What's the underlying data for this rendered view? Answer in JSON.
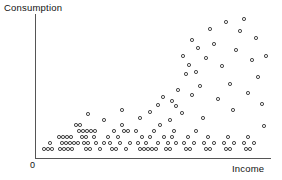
{
  "axes": {
    "y_title": "Consumption",
    "x_title": "Income",
    "origin_label": "0"
  },
  "chart_data": {
    "type": "scatter",
    "title": "",
    "xlabel": "Income",
    "ylabel": "Consumption",
    "xlim": [
      0,
      100
    ],
    "ylim": [
      0,
      100
    ],
    "grid": false,
    "legend": false,
    "marker": "open-circle",
    "marker_color": "#2b2b2b",
    "series": [
      {
        "name": "Households",
        "x": [
          7.0,
          8.6,
          10.2,
          12.2,
          13.8,
          15.4,
          17.0,
          18.6,
          9.4,
          11.0,
          12.6,
          14.2,
          15.8,
          11.8,
          13.4,
          15.0,
          16.6,
          19.0,
          20.6,
          22.2,
          23.8,
          25.4,
          21.0,
          22.6,
          24.2,
          25.8,
          27.4,
          21.4,
          23.0,
          24.6,
          26.2,
          19.8,
          28.6,
          30.2,
          31.8,
          29.0,
          30.6,
          32.2,
          33.8,
          35.4,
          29.4,
          31.0,
          26.6,
          24.6,
          36.6,
          38.2,
          39.8,
          41.4,
          37.0,
          38.6,
          40.2,
          43.0,
          44.6,
          46.2,
          47.8,
          45.0,
          49.4,
          51.0,
          52.6,
          54.2,
          50.2,
          53.0,
          55.8,
          57.4,
          59.0,
          56.2,
          60.6,
          62.2,
          63.8,
          61.0,
          65.4,
          67.0,
          68.6,
          66.2,
          70.2,
          71.8,
          73.4,
          69.0,
          75.0,
          76.6,
          78.2,
          74.0,
          80.0,
          81.6,
          83.2,
          79.2,
          85.0,
          86.6,
          88.2,
          84.2,
          90.0,
          92.0,
          94.0,
          96.0,
          55.0,
          58.0,
          62.0,
          66.0,
          70.0,
          74.0,
          78.0,
          82.0,
          86.0,
          90.0,
          94.0,
          64.0,
          68.0,
          72.0,
          76.0,
          80.0,
          84.0,
          88.0,
          92.0,
          96.0,
          72.0,
          76.0,
          82.0,
          88.0,
          93.0,
          97.0,
          60.0,
          67.0,
          73.0,
          79.0,
          85.0,
          91.0,
          97.0
        ],
        "y": [
          4.0,
          4.0,
          4.0,
          4.0,
          4.0,
          4.0,
          4.0,
          4.0,
          8.0,
          8.0,
          8.0,
          8.0,
          8.0,
          12.0,
          12.0,
          12.0,
          12.0,
          4.0,
          4.0,
          4.0,
          4.0,
          4.0,
          8.0,
          8.0,
          8.0,
          8.0,
          8.0,
          12.0,
          12.0,
          12.0,
          12.0,
          16.0,
          4.0,
          4.0,
          4.0,
          8.0,
          8.0,
          8.0,
          8.0,
          8.0,
          12.0,
          12.0,
          16.0,
          20.0,
          4.0,
          4.0,
          4.0,
          4.0,
          8.0,
          8.0,
          8.0,
          4.0,
          4.0,
          4.0,
          4.0,
          8.0,
          4.0,
          4.0,
          4.0,
          4.0,
          8.0,
          12.0,
          4.0,
          4.0,
          4.0,
          8.0,
          4.0,
          4.0,
          4.0,
          8.0,
          4.0,
          4.0,
          4.0,
          8.0,
          4.0,
          4.0,
          4.0,
          8.0,
          4.0,
          4.0,
          4.0,
          8.0,
          4.0,
          4.0,
          4.0,
          8.0,
          4.0,
          4.0,
          4.0,
          8.0,
          4.0,
          4.0,
          4.0,
          4.0,
          24.0,
          20.0,
          28.0,
          24.0,
          32.0,
          36.0,
          30.0,
          40.0,
          44.0,
          38.0,
          34.0,
          48.0,
          52.0,
          46.0,
          56.0,
          60.0,
          54.0,
          64.0,
          58.0,
          50.0,
          70.0,
          66.0,
          76.0,
          80.0,
          74.0,
          68.0,
          42.0,
          62.0,
          72.0,
          84.0,
          88.0,
          82.0,
          78.0
        ]
      }
    ]
  },
  "points": [
    {
      "x": 44,
      "y": 149
    },
    {
      "x": 48,
      "y": 149
    },
    {
      "x": 52,
      "y": 149
    },
    {
      "x": 60,
      "y": 149
    },
    {
      "x": 64,
      "y": 149
    },
    {
      "x": 68,
      "y": 149
    },
    {
      "x": 72,
      "y": 149
    },
    {
      "x": 50,
      "y": 143
    },
    {
      "x": 62,
      "y": 143
    },
    {
      "x": 66,
      "y": 143
    },
    {
      "x": 70,
      "y": 143
    },
    {
      "x": 74,
      "y": 143
    },
    {
      "x": 78,
      "y": 143
    },
    {
      "x": 59,
      "y": 137
    },
    {
      "x": 63,
      "y": 137
    },
    {
      "x": 67,
      "y": 137
    },
    {
      "x": 71,
      "y": 137
    },
    {
      "x": 86,
      "y": 149
    },
    {
      "x": 90,
      "y": 149
    },
    {
      "x": 100,
      "y": 149
    },
    {
      "x": 84,
      "y": 143
    },
    {
      "x": 88,
      "y": 143
    },
    {
      "x": 96,
      "y": 143
    },
    {
      "x": 104,
      "y": 143
    },
    {
      "x": 82,
      "y": 137
    },
    {
      "x": 86,
      "y": 137
    },
    {
      "x": 94,
      "y": 137
    },
    {
      "x": 79,
      "y": 131
    },
    {
      "x": 83,
      "y": 131
    },
    {
      "x": 87,
      "y": 131
    },
    {
      "x": 91,
      "y": 131
    },
    {
      "x": 95,
      "y": 131
    },
    {
      "x": 76,
      "y": 125
    },
    {
      "x": 80,
      "y": 125
    },
    {
      "x": 88,
      "y": 114
    },
    {
      "x": 112,
      "y": 149
    },
    {
      "x": 116,
      "y": 149
    },
    {
      "x": 126,
      "y": 149
    },
    {
      "x": 110,
      "y": 143
    },
    {
      "x": 120,
      "y": 143
    },
    {
      "x": 130,
      "y": 143
    },
    {
      "x": 108,
      "y": 137
    },
    {
      "x": 118,
      "y": 137
    },
    {
      "x": 114,
      "y": 131
    },
    {
      "x": 124,
      "y": 131
    },
    {
      "x": 128,
      "y": 131
    },
    {
      "x": 122,
      "y": 125
    },
    {
      "x": 104,
      "y": 120
    },
    {
      "x": 140,
      "y": 149
    },
    {
      "x": 144,
      "y": 149
    },
    {
      "x": 148,
      "y": 149
    },
    {
      "x": 152,
      "y": 149
    },
    {
      "x": 156,
      "y": 149
    },
    {
      "x": 138,
      "y": 143
    },
    {
      "x": 146,
      "y": 143
    },
    {
      "x": 158,
      "y": 143
    },
    {
      "x": 142,
      "y": 137
    },
    {
      "x": 150,
      "y": 137
    },
    {
      "x": 136,
      "y": 131
    },
    {
      "x": 154,
      "y": 131
    },
    {
      "x": 160,
      "y": 125
    },
    {
      "x": 166,
      "y": 149
    },
    {
      "x": 170,
      "y": 149
    },
    {
      "x": 168,
      "y": 143
    },
    {
      "x": 176,
      "y": 143
    },
    {
      "x": 164,
      "y": 137
    },
    {
      "x": 172,
      "y": 137
    },
    {
      "x": 174,
      "y": 131
    },
    {
      "x": 186,
      "y": 149
    },
    {
      "x": 190,
      "y": 149
    },
    {
      "x": 184,
      "y": 143
    },
    {
      "x": 194,
      "y": 143
    },
    {
      "x": 188,
      "y": 137
    },
    {
      "x": 196,
      "y": 131
    },
    {
      "x": 206,
      "y": 149
    },
    {
      "x": 210,
      "y": 149
    },
    {
      "x": 204,
      "y": 143
    },
    {
      "x": 214,
      "y": 143
    },
    {
      "x": 208,
      "y": 137
    },
    {
      "x": 226,
      "y": 149
    },
    {
      "x": 230,
      "y": 149
    },
    {
      "x": 224,
      "y": 143
    },
    {
      "x": 234,
      "y": 143
    },
    {
      "x": 228,
      "y": 137
    },
    {
      "x": 246,
      "y": 149
    },
    {
      "x": 250,
      "y": 149
    },
    {
      "x": 244,
      "y": 143
    },
    {
      "x": 254,
      "y": 143
    },
    {
      "x": 248,
      "y": 137
    },
    {
      "x": 122,
      "y": 110
    },
    {
      "x": 140,
      "y": 118
    },
    {
      "x": 150,
      "y": 112
    },
    {
      "x": 158,
      "y": 105
    },
    {
      "x": 163,
      "y": 97
    },
    {
      "x": 170,
      "y": 120
    },
    {
      "x": 172,
      "y": 101
    },
    {
      "x": 176,
      "y": 106
    },
    {
      "x": 178,
      "y": 90
    },
    {
      "x": 182,
      "y": 113
    },
    {
      "x": 186,
      "y": 74
    },
    {
      "x": 189,
      "y": 65
    },
    {
      "x": 192,
      "y": 95
    },
    {
      "x": 196,
      "y": 72
    },
    {
      "x": 200,
      "y": 86
    },
    {
      "x": 203,
      "y": 118
    },
    {
      "x": 206,
      "y": 58
    },
    {
      "x": 210,
      "y": 29
    },
    {
      "x": 214,
      "y": 44
    },
    {
      "x": 218,
      "y": 99
    },
    {
      "x": 222,
      "y": 66
    },
    {
      "x": 226,
      "y": 22
    },
    {
      "x": 230,
      "y": 84
    },
    {
      "x": 233,
      "y": 110
    },
    {
      "x": 236,
      "y": 50
    },
    {
      "x": 240,
      "y": 31
    },
    {
      "x": 244,
      "y": 19
    },
    {
      "x": 248,
      "y": 93
    },
    {
      "x": 252,
      "y": 60
    },
    {
      "x": 256,
      "y": 38
    },
    {
      "x": 258,
      "y": 77
    },
    {
      "x": 262,
      "y": 104
    },
    {
      "x": 264,
      "y": 126
    },
    {
      "x": 266,
      "y": 56
    },
    {
      "x": 198,
      "y": 48
    },
    {
      "x": 183,
      "y": 56
    },
    {
      "x": 192,
      "y": 40
    }
  ]
}
